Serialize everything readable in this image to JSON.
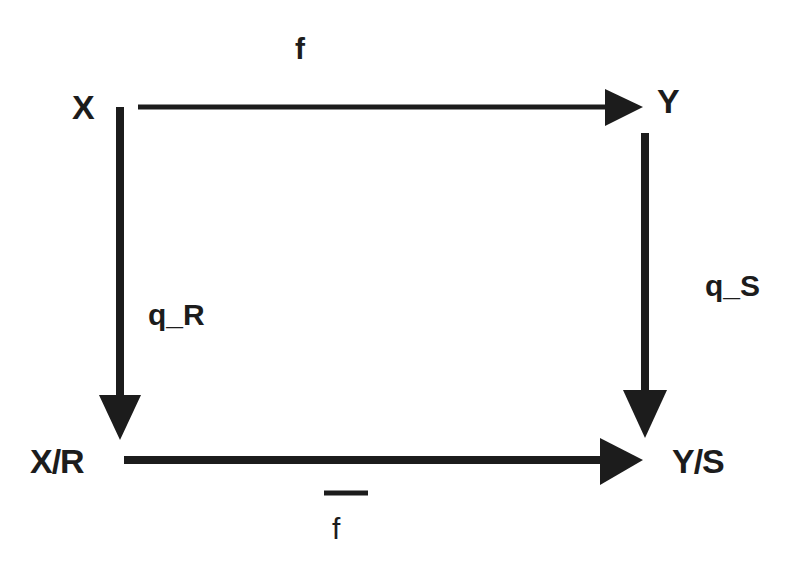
{
  "diagram": {
    "type": "commutative-diagram",
    "nodes": {
      "top_left": "X",
      "top_right": "Y",
      "bottom_left": "X/R",
      "bottom_right": "Y/S"
    },
    "edges": {
      "top": {
        "label": "f",
        "from": "X",
        "to": "Y"
      },
      "left": {
        "label": "q_R",
        "from": "X",
        "to": "X/R"
      },
      "right": {
        "label": "q_S",
        "from": "Y",
        "to": "Y/S"
      },
      "bottom": {
        "label": "f",
        "overbar": true,
        "from": "X/R",
        "to": "Y/S"
      }
    },
    "colors": {
      "stroke": "#1c1c1c",
      "background": "#ffffff"
    }
  }
}
